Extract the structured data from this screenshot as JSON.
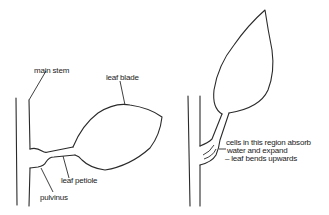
{
  "diagram": {
    "left_panel": {
      "labels": {
        "main_stem": "main stem",
        "leaf_blade": "leaf blade",
        "leaf_petiole": "leaf petiole",
        "pulvinus": "pulvinus"
      }
    },
    "right_panel": {
      "annotation": {
        "line1": "cells in this region absorb",
        "line2": "water and expand",
        "line3": "– leaf bends upwards"
      }
    },
    "colors": {
      "line": "#2a2a2a",
      "background": "#ffffff"
    }
  }
}
